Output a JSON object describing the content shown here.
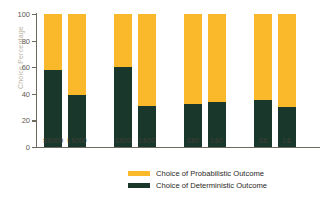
{
  "chart_data": {
    "type": "bar",
    "title": "",
    "subtitle": "",
    "xlabel": "",
    "ylabel": "Choice Percentage",
    "ylim": [
      0,
      100
    ],
    "yticks": [
      0,
      20,
      40,
      60,
      80,
      100
    ],
    "ytick_labels": [
      "0",
      "20",
      "40",
      "60",
      "80",
      "100"
    ],
    "grid": false,
    "stacked": true,
    "legend_position": "bottom",
    "categories": [
      "S6000",
      "L6000",
      "S600",
      "L600",
      "S60",
      "L60",
      "S6",
      "L6"
    ],
    "groups": [
      {
        "name": "6000",
        "categories": [
          "S6000",
          "L6000"
        ]
      },
      {
        "name": "600",
        "categories": [
          "S600",
          "L600"
        ]
      },
      {
        "name": "60",
        "categories": [
          "S60",
          "L60"
        ]
      },
      {
        "name": "6",
        "categories": [
          "S6",
          "L6"
        ]
      }
    ],
    "series": [
      {
        "name": "Choice of Deterministic Outcome",
        "color": "#19372a",
        "values": [
          58,
          39,
          60,
          31,
          32,
          34,
          35,
          30
        ]
      },
      {
        "name": "Choice of Probabilistic Outcome",
        "color": "#f9b92a",
        "values": [
          42,
          61,
          40,
          69,
          68,
          66,
          65,
          70
        ]
      }
    ]
  },
  "axis": {
    "y_title": "Choice Percentage",
    "axis_color": "#6e6a5e"
  },
  "legend": {
    "items": [
      {
        "label": "Choice of Probabilistic Outcome",
        "color": "#f9b92a"
      },
      {
        "label": "Choice of Deterministic Outcome",
        "color": "#19372a"
      }
    ]
  }
}
